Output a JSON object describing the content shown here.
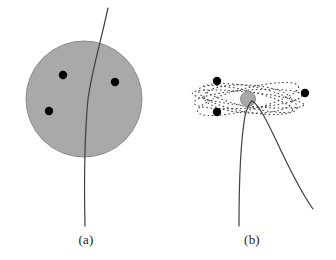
{
  "figure": {
    "background_color": "#ffffff",
    "panels": [
      {
        "id": "panel-a",
        "caption": "(a)",
        "caption_x": 86,
        "caption_y": 244,
        "model_name": "uniform-sphere-model",
        "sphere": {
          "cx": 84,
          "cy": 99,
          "r": 58,
          "fill": "#a9a9a9",
          "stroke": "#8c8c8c"
        },
        "charges": [
          {
            "cx": 63,
            "cy": 75,
            "r": 4.2,
            "fill": "#000000"
          },
          {
            "cx": 115,
            "cy": 82,
            "r": 4.2,
            "fill": "#000000"
          },
          {
            "cx": 49,
            "cy": 111,
            "r": 4.2,
            "fill": "#000000"
          }
        ],
        "trajectory": {
          "stroke": "#404040",
          "stroke_width": 1.2,
          "path": "M 108 8 C 100 45, 92 70, 88 99 C 85 130, 84 180, 85 226"
        }
      },
      {
        "id": "panel-b",
        "caption": "(b)",
        "caption_x": 252,
        "caption_y": 244,
        "model_name": "nuclear-model",
        "nucleus": {
          "cx": 248,
          "cy": 99,
          "r": 7.5,
          "fill": "#a9a9a9",
          "stroke": "#8c8c8c"
        },
        "electrons": [
          {
            "cx": 217,
            "cy": 81,
            "r": 4.2,
            "fill": "#000000"
          },
          {
            "cx": 217,
            "cy": 112,
            "r": 4.2,
            "fill": "#000000"
          },
          {
            "cx": 305,
            "cy": 93,
            "r": 4.2,
            "fill": "#000000"
          }
        ],
        "orbits": [
          {
            "rx": 54,
            "ry": 9,
            "rotate": -4
          },
          {
            "rx": 50,
            "ry": 13,
            "rotate": 10
          },
          {
            "rx": 46,
            "ry": 8,
            "rotate": 14
          },
          {
            "rx": 52,
            "ry": 11,
            "rotate": -14
          },
          {
            "rx": 44,
            "ry": 14,
            "rotate": 3
          },
          {
            "rx": 56,
            "ry": 7,
            "rotate": 6
          }
        ],
        "orbit_style": {
          "stroke": "#3a3a3a",
          "stroke_width": 1,
          "dash": "1.6 2.6",
          "fill": "none"
        },
        "trajectories": [
          {
            "name": "incoming-branch",
            "stroke": "#404040",
            "stroke_width": 1.2,
            "path": "M 239 226 C 239 190, 240 145, 245 116 C 247 108, 249 103, 252 101"
          },
          {
            "name": "deflected-branch",
            "stroke": "#404040",
            "stroke_width": 1.2,
            "path": "M 252 101 C 258 104, 264 115, 275 138 C 288 166, 303 195, 313 209"
          }
        ]
      }
    ]
  }
}
